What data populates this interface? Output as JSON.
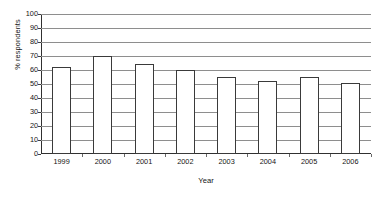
{
  "chart_data": {
    "type": "bar",
    "title": "",
    "subtitle": "",
    "xlabel": "Year",
    "ylabel": "% respondents",
    "categories": [
      "1999",
      "2000",
      "2001",
      "2002",
      "2003",
      "2004",
      "2005",
      "2006"
    ],
    "values": [
      62,
      70,
      64,
      60,
      55,
      52,
      55,
      51
    ],
    "series": [
      {
        "name": "% respondents",
        "values": [
          62,
          70,
          64,
          60,
          55,
          52,
          55,
          51
        ]
      }
    ],
    "ylim": [
      0,
      100
    ],
    "yticks": [
      0,
      10,
      20,
      30,
      40,
      50,
      60,
      70,
      80,
      90,
      100
    ],
    "ytick_labels": [
      "0",
      "10",
      "20",
      "30",
      "40",
      "50",
      "60",
      "70",
      "80",
      "90",
      "100"
    ],
    "grid": "horizontal",
    "legend": "none",
    "bar_fill_color": "#ffffff",
    "bar_border_color": "#3a3a3a",
    "gridline_color": "#8e8e8e",
    "axis_color": "#303030",
    "background_color": "#ffffff",
    "annotations": []
  }
}
